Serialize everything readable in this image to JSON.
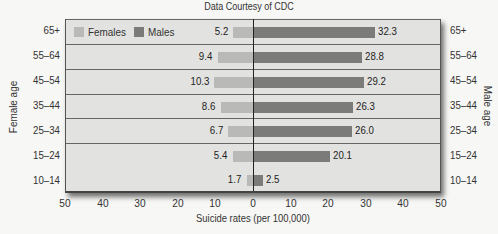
{
  "chart_data": {
    "type": "bar",
    "orientation": "horizontal",
    "subtype": "population-pyramid",
    "title": "",
    "credit": "Data Courtesy of CDC",
    "categories": [
      "65+",
      "55–64",
      "45–54",
      "35–44",
      "25–34",
      "15–24",
      "10–14"
    ],
    "series": [
      {
        "name": "Females",
        "color": "#b9b9b7",
        "values": [
          5.2,
          9.4,
          10.3,
          8.6,
          6.7,
          5.4,
          1.7
        ]
      },
      {
        "name": "Males",
        "color": "#7b7b79",
        "values": [
          32.3,
          28.8,
          29.2,
          26.3,
          26.0,
          20.1,
          2.5
        ]
      }
    ],
    "xlabel": "Suicide rates (per 100,000)",
    "ylabel_left": "Female age",
    "ylabel_right": "Male age",
    "xlim": [
      -50,
      50
    ],
    "xticks": [
      "50",
      "40",
      "30",
      "20",
      "10",
      "0",
      "10",
      "20",
      "30",
      "40",
      "50"
    ],
    "grid": "horizontal row separators",
    "legend_position": "top-left inside plot"
  },
  "legend": {
    "females": "Females",
    "males": "Males"
  }
}
